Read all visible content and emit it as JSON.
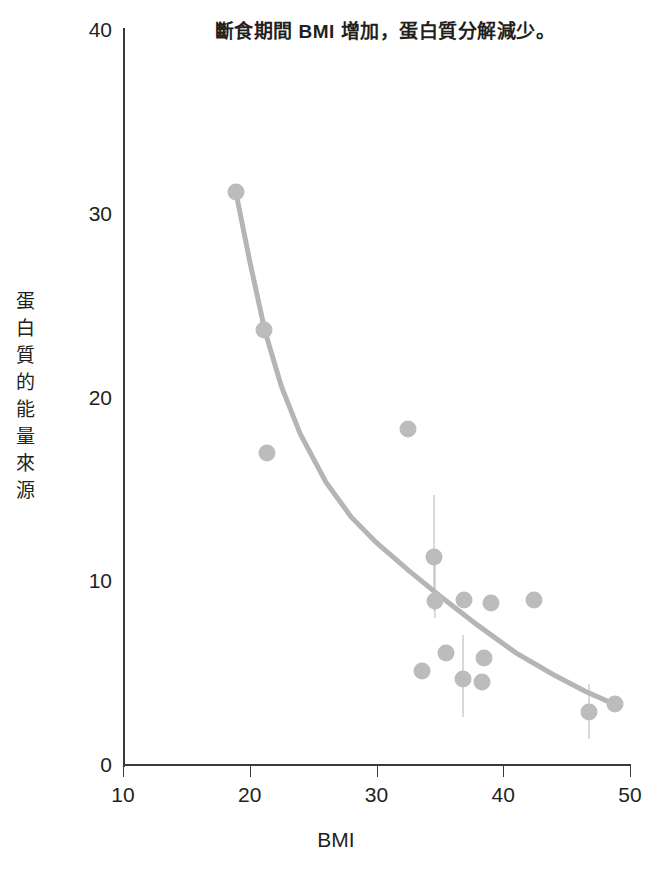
{
  "chart_data": {
    "type": "scatter",
    "title": "斷食期間 BMI 增加，蛋白質分解減少。",
    "xlabel": "BMI",
    "ylabel": "蛋白質的能量來源",
    "ylabel_chars": [
      "蛋",
      "白",
      "質",
      "的",
      "能",
      "量",
      "來",
      "源"
    ],
    "xlim": [
      10,
      50
    ],
    "ylim": [
      0,
      40
    ],
    "xticks": [
      10,
      20,
      30,
      40,
      50
    ],
    "yticks": [
      0,
      10,
      20,
      30,
      40
    ],
    "grid": false,
    "legend": null,
    "marker_color": "#bcbcbc",
    "trendline_color": "#b5b5b5",
    "axis_color": "#3a3a3c",
    "points": [
      {
        "x": 18.9,
        "y": 31.2,
        "err_low": null,
        "err_high": null
      },
      {
        "x": 21.1,
        "y": 23.7,
        "err_low": null,
        "err_high": null
      },
      {
        "x": 21.4,
        "y": 17.0,
        "err_low": null,
        "err_high": null
      },
      {
        "x": 32.5,
        "y": 18.3,
        "err_low": null,
        "err_high": null
      },
      {
        "x": 33.6,
        "y": 5.1,
        "err_low": null,
        "err_high": null
      },
      {
        "x": 34.5,
        "y": 11.3,
        "err_low": 8.4,
        "err_high": 14.7
      },
      {
        "x": 34.6,
        "y": 8.9,
        "err_low": 8.0,
        "err_high": 11.1
      },
      {
        "x": 35.5,
        "y": 6.1,
        "err_low": null,
        "err_high": null
      },
      {
        "x": 36.9,
        "y": 9.0,
        "err_low": null,
        "err_high": null
      },
      {
        "x": 36.8,
        "y": 4.7,
        "err_low": 2.6,
        "err_high": 7.1
      },
      {
        "x": 38.5,
        "y": 5.8,
        "err_low": null,
        "err_high": null
      },
      {
        "x": 39.0,
        "y": 8.8,
        "err_low": null,
        "err_high": null
      },
      {
        "x": 38.3,
        "y": 4.5,
        "err_low": null,
        "err_high": null
      },
      {
        "x": 42.4,
        "y": 9.0,
        "err_low": null,
        "err_high": null
      },
      {
        "x": 46.8,
        "y": 2.9,
        "err_low": 1.4,
        "err_high": 4.4
      },
      {
        "x": 48.8,
        "y": 3.3,
        "err_low": null,
        "err_high": null
      }
    ],
    "trendline": {
      "description": "decaying power-law fit",
      "points": [
        {
          "x": 18.9,
          "y": 31.2
        },
        {
          "x": 20.0,
          "y": 27.4
        },
        {
          "x": 21.2,
          "y": 23.6
        },
        {
          "x": 22.5,
          "y": 20.6
        },
        {
          "x": 24.0,
          "y": 18.0
        },
        {
          "x": 26.0,
          "y": 15.4
        },
        {
          "x": 28.0,
          "y": 13.5
        },
        {
          "x": 30.0,
          "y": 12.1
        },
        {
          "x": 32.5,
          "y": 10.6
        },
        {
          "x": 35.0,
          "y": 9.2
        },
        {
          "x": 38.0,
          "y": 7.6
        },
        {
          "x": 41.0,
          "y": 6.1
        },
        {
          "x": 44.0,
          "y": 4.9
        },
        {
          "x": 46.5,
          "y": 4.0
        },
        {
          "x": 48.8,
          "y": 3.3
        }
      ]
    }
  }
}
